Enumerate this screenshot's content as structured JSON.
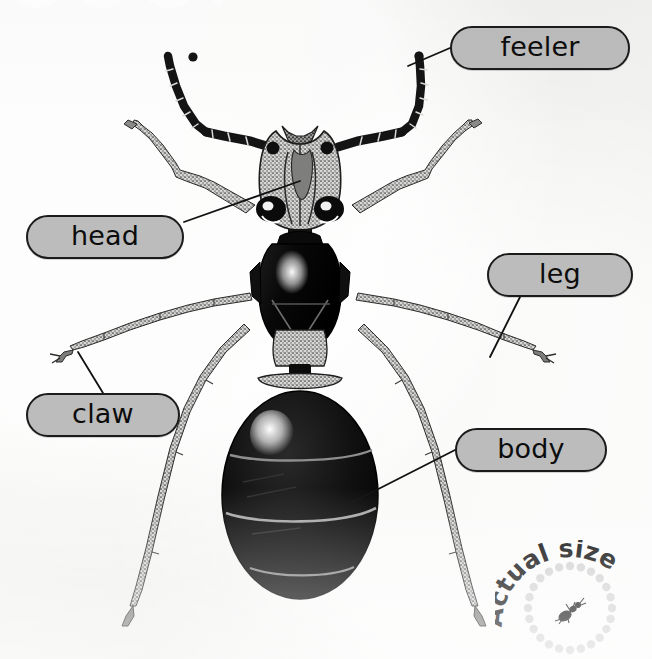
{
  "page": {
    "background_color": "#f1f1ef",
    "width": 652,
    "height": 659
  },
  "subject": {
    "name": "ant",
    "view": "dorsal",
    "parts_shown": [
      "feeler",
      "head",
      "leg",
      "claw",
      "body"
    ]
  },
  "decor": {
    "cloud_name": "scalloped-cloud-shape",
    "cloud_color": "#ffffff"
  },
  "labels": [
    {
      "id": "feeler",
      "text": "feeler",
      "fill": "#bcbcbc",
      "stroke": "#1b1b1b"
    },
    {
      "id": "head",
      "text": "head",
      "fill": "#bcbcbc",
      "stroke": "#1b1b1b"
    },
    {
      "id": "leg",
      "text": "leg",
      "fill": "#bcbcbc",
      "stroke": "#1b1b1b"
    },
    {
      "id": "claw",
      "text": "claw",
      "fill": "#bcbcbc",
      "stroke": "#1b1b1b"
    },
    {
      "id": "body",
      "text": "body",
      "fill": "#bcbcbc",
      "stroke": "#1b1b1b"
    }
  ],
  "actual_size_badge": {
    "text": "Actual size",
    "letters": [
      "A",
      "c",
      "t",
      "u",
      "a",
      "l",
      " ",
      "s",
      "i",
      "z",
      "e"
    ],
    "dot_color": "#d2d2d2",
    "ant_color": "#111111",
    "icon_name": "tiny-ant-icon"
  }
}
